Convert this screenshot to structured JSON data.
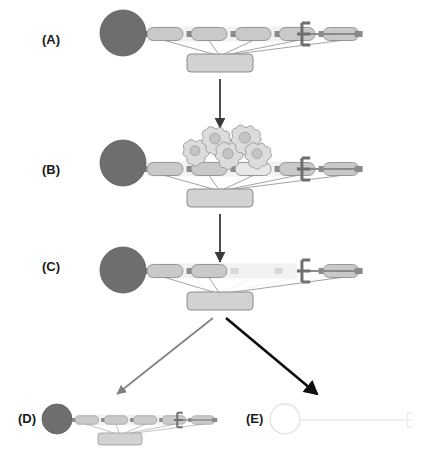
{
  "figure": {
    "background_color": "#ffffff",
    "panel_label_font_size": 13
  },
  "palette": {
    "head_fill_dark": "#6e6e6e",
    "head_stroke_dark": "#5a5a5a",
    "head_fill_ghost": "#ffffff",
    "head_stroke_ghost": "#e3e3e3",
    "segment_fill": "#c9c9c9",
    "segment_fill_light": "#e8e8e8",
    "segment_fill_faded": "#f2f2f2",
    "segment_stroke": "#8f8f8f",
    "segment_stroke_faded": "#ededed",
    "connector_fill": "#8a8a8a",
    "connector_fill_faded": "#d8d8d8",
    "base_plate_fill": "#d2d2d2",
    "base_plate_stroke": "#8a8a8a",
    "tether_stroke": "#8a8a8a",
    "terminal_stroke": "#6f6f6f",
    "terminal_stroke_ghost": "#e6e6e6",
    "blob_fill": "#dcdcdc",
    "blob_stroke": "#9a9a9a",
    "blob_core_fill": "#c4c4c4",
    "arrow_dark": "#3a3a3a",
    "arrow_black": "#0d0d0d",
    "arrow_gray": "#808080",
    "ghost_line": "#eeeeee"
  },
  "panels": [
    {
      "id": "A",
      "label": "(A)",
      "label_x": 42,
      "label_y": 44,
      "description": "Intact assembly: dark head domain, five light segments joined by connectors, terminal comb, tethered base plate",
      "head": {
        "cx": 123,
        "cy": 33,
        "rx": 23,
        "ry": 23,
        "state": "solid"
      },
      "axis_y": 34,
      "segment_count": 5,
      "segments_state": [
        "normal",
        "normal",
        "normal",
        "normal",
        "normal"
      ],
      "base_plate": {
        "x": 187,
        "y": 54,
        "w": 66,
        "h": 18
      },
      "terminal_x": 297,
      "blobs": [],
      "scale": 1.0
    },
    {
      "id": "B",
      "label": "(B)",
      "label_x": 42,
      "label_y": 174,
      "description": "Blob-shaped degradation factors dock onto the central segments; middle segment is lightened",
      "head": {
        "cx": 123,
        "cy": 163,
        "rx": 23,
        "ry": 23,
        "state": "solid"
      },
      "axis_y": 169,
      "segment_count": 5,
      "segments_state": [
        "normal",
        "normal",
        "lightened",
        "normal",
        "normal"
      ],
      "base_plate": {
        "x": 187,
        "y": 189,
        "w": 66,
        "h": 18
      },
      "terminal_x": 297,
      "blobs": [
        {
          "cx": 196,
          "cy": 152,
          "r": 12.5
        },
        {
          "cx": 216,
          "cy": 140,
          "r": 13.5
        },
        {
          "cx": 229,
          "cy": 155,
          "r": 13.0
        },
        {
          "cx": 246,
          "cy": 139,
          "r": 14.0
        },
        {
          "cx": 258,
          "cy": 155,
          "r": 12.5
        }
      ],
      "scale": 1.0
    },
    {
      "id": "C",
      "label": "(C)",
      "label_x": 42,
      "label_y": 271,
      "description": "Central segments have been removed leaving a faded gap with a residual connector stub",
      "head": {
        "cx": 123,
        "cy": 270,
        "rx": 23,
        "ry": 23,
        "state": "solid"
      },
      "axis_y": 271,
      "segment_count": 5,
      "segments_state": [
        "normal",
        "normal",
        "removed",
        "removed",
        "normal"
      ],
      "base_plate": {
        "x": 187,
        "y": 292,
        "w": 66,
        "h": 18
      },
      "terminal_x": 297,
      "blobs": [],
      "scale": 1.0
    },
    {
      "id": "D",
      "label": "(D)",
      "label_x": 18,
      "label_y": 423,
      "description": "Reassembled compact complex, drawn at reduced scale",
      "head": {
        "cx": 57,
        "cy": 419,
        "rx": 15,
        "ry": 15,
        "state": "solid"
      },
      "axis_y": 420,
      "segment_count": 5,
      "segments_state": [
        "normal",
        "normal",
        "normal",
        "normal",
        "normal"
      ],
      "base_plate": {
        "x": 98,
        "y": 433,
        "w": 44,
        "h": 12
      },
      "terminal_x": 174,
      "blobs": [],
      "scale": 0.66
    },
    {
      "id": "E",
      "label": "(E)",
      "label_x": 246,
      "label_y": 423,
      "description": "Fully dissolved ghost outline: empty head circle and a bare faded filament ending in a faint comb",
      "head": {
        "cx": 285,
        "cy": 419,
        "rx": 15,
        "ry": 15,
        "state": "ghost"
      },
      "axis_y": 420,
      "segment_count": 0,
      "segments_state": [],
      "base_plate": null,
      "terminal_x": 404,
      "blobs": [],
      "scale": 0.66
    }
  ],
  "arrows": [
    {
      "name": "arrow-a-to-b",
      "from_panel": "A",
      "to_panel": "B",
      "x1": 220,
      "y1": 79,
      "x2": 220,
      "y2": 128,
      "color_key": "arrow_dark",
      "width": 1.8,
      "style": "straight-down"
    },
    {
      "name": "arrow-b-to-c",
      "from_panel": "B",
      "to_panel": "C",
      "x1": 220,
      "y1": 214,
      "x2": 220,
      "y2": 262,
      "color_key": "arrow_dark",
      "width": 1.8,
      "style": "straight-down"
    },
    {
      "name": "arrow-c-to-d",
      "from_panel": "C",
      "to_panel": "D",
      "x1": 213,
      "y1": 318,
      "x2": 117,
      "y2": 394,
      "color_key": "arrow_gray",
      "width": 1.6,
      "style": "diagonal-left"
    },
    {
      "name": "arrow-c-to-e",
      "from_panel": "C",
      "to_panel": "E",
      "x1": 226,
      "y1": 318,
      "x2": 317,
      "y2": 394,
      "color_key": "arrow_black",
      "width": 2.6,
      "style": "diagonal-right"
    }
  ],
  "geometry": {
    "segment_width": 36,
    "segment_height": 13,
    "segment_gap": 8,
    "segment_start_x": 147,
    "connector_width": 8,
    "connector_height": 6,
    "terminal_arm": 11,
    "terminal_half_height": 11
  }
}
